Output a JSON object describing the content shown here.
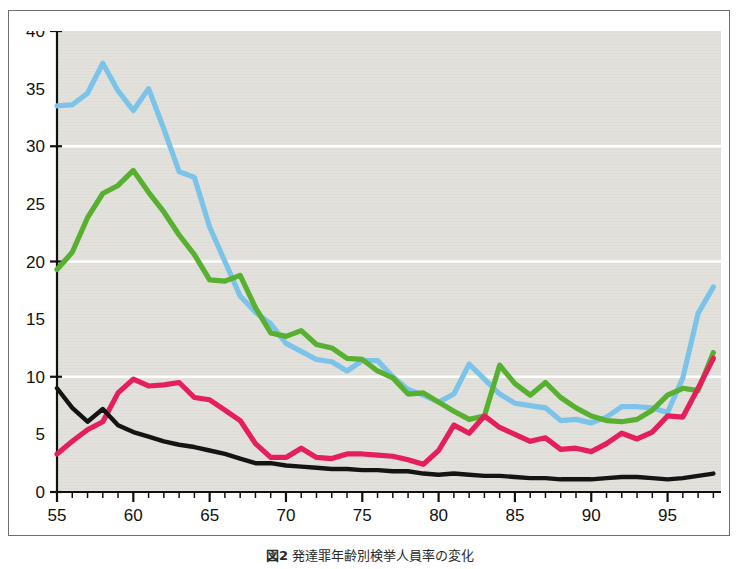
{
  "figure": {
    "caption_label": "図2",
    "caption_text": "発達罪年齢別検挙人員率の変化",
    "annotations": [
      {
        "name": "adult-label",
        "text": "成人",
        "x": 1996.0,
        "y": 3.0,
        "color": "#111111"
      }
    ]
  },
  "colors": {
    "plot_background": "#dedcd6",
    "grid": "#ffffff",
    "axis": "#111111",
    "frame": "#6e6e6e",
    "series_blue": "#7cc3ea",
    "series_green": "#58b030",
    "series_red": "#e41f5c",
    "series_black": "#141414"
  },
  "chart_data": {
    "type": "line",
    "title": "",
    "subtitle": "",
    "xlabel": "",
    "ylabel": "",
    "xlim": [
      55,
      98.5
    ],
    "ylim": [
      0,
      40
    ],
    "grid": true,
    "grid_y_values": [
      10,
      20,
      30
    ],
    "legend_position": "inline-annotation",
    "x_major_ticks": [
      55,
      60,
      65,
      70,
      75,
      80,
      85,
      90,
      95
    ],
    "x_tick_labels": [
      "55",
      "60",
      "65",
      "70",
      "75",
      "80",
      "85",
      "90",
      "95"
    ],
    "x_minor_tick_step": 1,
    "y_ticks": [
      0,
      5,
      10,
      15,
      20,
      25,
      30,
      35,
      40
    ],
    "y_tick_labels": [
      "0",
      "5",
      "10",
      "15",
      "20",
      "25",
      "30",
      "35",
      "40"
    ],
    "y_major_tick_values": [
      0,
      10,
      20,
      30,
      40
    ],
    "x": [
      55,
      56,
      57,
      58,
      59,
      60,
      61,
      62,
      63,
      64,
      65,
      66,
      67,
      68,
      69,
      70,
      71,
      72,
      73,
      74,
      75,
      76,
      77,
      78,
      79,
      80,
      81,
      82,
      83,
      84,
      85,
      86,
      87,
      88,
      89,
      90,
      91,
      92,
      93,
      94,
      95,
      96,
      97,
      98
    ],
    "series": [
      {
        "name": "blue-series",
        "color": "#7cc3ea",
        "values": [
          33.5,
          33.6,
          34.6,
          37.2,
          34.8,
          33.1,
          35.0,
          31.5,
          27.8,
          27.3,
          23.0,
          20.0,
          17.0,
          15.6,
          14.6,
          12.9,
          12.2,
          11.5,
          11.3,
          10.5,
          11.4,
          11.4,
          10.0,
          8.9,
          8.4,
          7.8,
          8.5,
          11.1,
          9.8,
          8.5,
          7.7,
          7.5,
          7.3,
          6.2,
          6.3,
          6.0,
          6.5,
          7.4,
          7.4,
          7.3,
          6.9,
          9.9,
          15.5,
          17.8
        ]
      },
      {
        "name": "green-series",
        "color": "#58b030",
        "values": [
          19.3,
          20.8,
          23.8,
          25.9,
          26.6,
          27.9,
          26.0,
          24.3,
          22.3,
          20.6,
          18.4,
          18.3,
          18.8,
          16.0,
          13.8,
          13.5,
          14.0,
          12.8,
          12.5,
          11.6,
          11.5,
          10.5,
          9.9,
          8.5,
          8.6,
          7.8,
          7.0,
          6.3,
          6.6,
          11.0,
          9.4,
          8.4,
          9.5,
          8.2,
          7.3,
          6.6,
          6.2,
          6.1,
          6.3,
          7.1,
          8.4,
          9.0,
          8.8,
          12.1
        ]
      },
      {
        "name": "red-series",
        "color": "#e41f5c",
        "values": [
          3.3,
          4.4,
          5.4,
          6.1,
          8.6,
          9.8,
          9.2,
          9.3,
          9.5,
          8.2,
          8.0,
          7.1,
          6.2,
          4.2,
          3.0,
          3.0,
          3.8,
          3.0,
          2.9,
          3.3,
          3.3,
          3.2,
          3.1,
          2.8,
          2.4,
          3.6,
          5.8,
          5.1,
          6.6,
          5.6,
          5.0,
          4.4,
          4.7,
          3.7,
          3.8,
          3.5,
          4.2,
          5.1,
          4.6,
          5.2,
          6.6,
          6.5,
          9.0,
          11.6
        ]
      },
      {
        "name": "black-series",
        "color": "#141414",
        "values": [
          9.0,
          7.3,
          6.1,
          7.2,
          5.8,
          5.2,
          4.8,
          4.4,
          4.1,
          3.9,
          3.6,
          3.3,
          2.9,
          2.5,
          2.5,
          2.3,
          2.2,
          2.1,
          2.0,
          2.0,
          1.9,
          1.9,
          1.8,
          1.8,
          1.6,
          1.5,
          1.6,
          1.5,
          1.4,
          1.4,
          1.3,
          1.2,
          1.2,
          1.1,
          1.1,
          1.1,
          1.2,
          1.3,
          1.3,
          1.2,
          1.1,
          1.2,
          1.4,
          1.6
        ]
      }
    ]
  }
}
